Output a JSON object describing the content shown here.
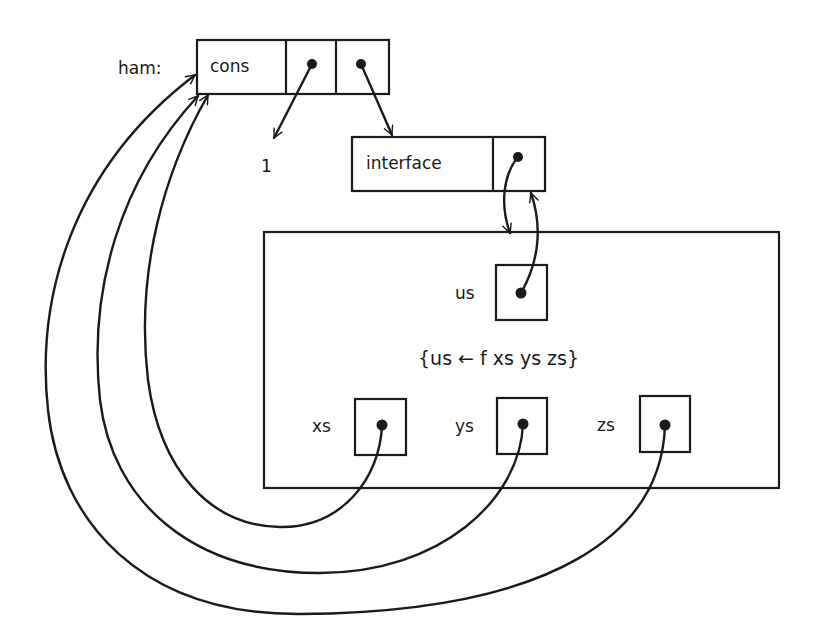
{
  "diagram": {
    "type": "memory-structure",
    "root_label": "ham:",
    "cons_cell": {
      "tag": "cons",
      "fields": [
        "car-pointer",
        "cdr-pointer"
      ],
      "car_target": "1",
      "cdr_target": "interface"
    },
    "interface_cell": {
      "tag": "interface",
      "pointer_target": "process-box"
    },
    "process_box": {
      "output_var": "us",
      "equation": "{us ← f xs ys zs}",
      "input_vars": [
        "xs",
        "ys",
        "zs"
      ]
    },
    "constant_value": "1",
    "edges": [
      {
        "from": "cons.car",
        "to": "1"
      },
      {
        "from": "cons.cdr",
        "to": "interface"
      },
      {
        "from": "interface.ptr",
        "to": "process-box"
      },
      {
        "from": "us",
        "to": "interface"
      },
      {
        "from": "xs",
        "to": "cons"
      },
      {
        "from": "ys",
        "to": "cons"
      },
      {
        "from": "zs",
        "to": "cons"
      }
    ],
    "colors": {
      "ink": "#1a1a1a",
      "background": "#ffffff"
    }
  }
}
